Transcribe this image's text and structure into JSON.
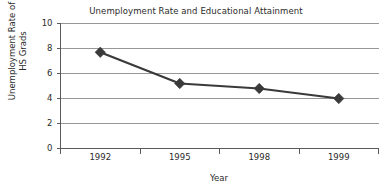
{
  "chart_data": {
    "type": "line",
    "title": "Unemployment Rate and Educational Attainment",
    "xlabel": "Year",
    "ylabel": "Unemployment Rate of HS Grads",
    "ylabel_lines": [
      "Unemployment Rate of",
      "HS Grads"
    ],
    "categories": [
      "1992",
      "1995",
      "1998",
      "1999"
    ],
    "values": [
      7.7,
      5.2,
      4.8,
      4.0
    ],
    "series": [
      {
        "name": "Unemployment Rate of HS Grads",
        "values": [
          7.7,
          5.2,
          4.8,
          4.0
        ]
      }
    ],
    "ylim": [
      0,
      10
    ],
    "ytick_labels": [
      "0",
      "2",
      "4",
      "6",
      "8",
      "10"
    ],
    "ytick_values": [
      0,
      2,
      4,
      6,
      8,
      10
    ],
    "grid": "horizontal",
    "legend": "none",
    "marker": "diamond",
    "colors": {
      "line": "#3a3a3a",
      "marker": "#3a3a3a",
      "grid": "#8c8c8c",
      "axis": "#5a5a5a",
      "text": "#2b2b2b",
      "background": "#ffffff"
    }
  }
}
